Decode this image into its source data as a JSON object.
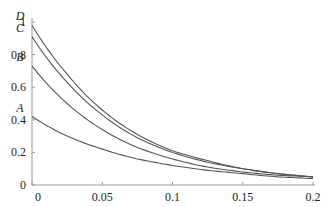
{
  "chart_data": {
    "type": "line",
    "title": "",
    "xlabel": "",
    "ylabel": "",
    "xlim": [
      0,
      0.2
    ],
    "ylim": [
      0,
      1
    ],
    "grid": false,
    "legend": "none (curves labeled at y-axis)",
    "x_ticks": [
      "0",
      "0.05",
      "0.1",
      "0.15",
      "0.2"
    ],
    "y_ticks": [
      "0",
      "0.2",
      "0.4",
      "0.6",
      "0.8",
      "1"
    ],
    "x": [
      0,
      0.025,
      0.05,
      0.075,
      0.1,
      0.125,
      0.15,
      0.175,
      0.2
    ],
    "series": [
      {
        "name": "A",
        "values": [
          0.42,
          0.3,
          0.22,
          0.16,
          0.12,
          0.09,
          0.07,
          0.05,
          0.04
        ]
      },
      {
        "name": "B",
        "values": [
          0.73,
          0.5,
          0.34,
          0.23,
          0.16,
          0.11,
          0.08,
          0.06,
          0.05
        ]
      },
      {
        "name": "C",
        "values": [
          0.91,
          0.63,
          0.43,
          0.29,
          0.2,
          0.14,
          0.1,
          0.07,
          0.05
        ]
      },
      {
        "name": "D",
        "values": [
          0.98,
          0.68,
          0.46,
          0.31,
          0.21,
          0.15,
          0.1,
          0.07,
          0.05
        ]
      }
    ],
    "line_color": "#555555"
  }
}
